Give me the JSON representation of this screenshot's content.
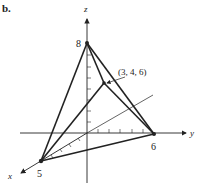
{
  "figure": {
    "panel_label": "b.",
    "axes": {
      "x_label": "x",
      "y_label": "y",
      "z_label": "z"
    },
    "intercepts": {
      "x": "5",
      "y": "6",
      "z": "8"
    },
    "point_label": "(3, 4, 6)",
    "colors": {
      "line": "#222222",
      "background": "#ffffff"
    }
  }
}
